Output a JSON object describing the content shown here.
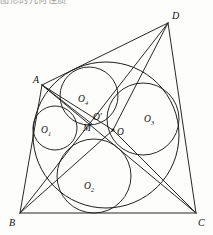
{
  "caption": {
    "clipped_header_text": "图形的几何性质"
  },
  "figure": {
    "ink_color": "#1b1b1b",
    "background_color": "#fdfdfc",
    "vertices": [
      {
        "id": "A",
        "label": "A",
        "x": 42,
        "y": 85,
        "label_x": 33,
        "label_y": 83
      },
      {
        "id": "B",
        "label": "B",
        "x": 20,
        "y": 213,
        "label_x": 9,
        "label_y": 226
      },
      {
        "id": "C",
        "label": "C",
        "x": 196,
        "y": 213,
        "label_x": 198,
        "label_y": 226
      },
      {
        "id": "D",
        "label": "D",
        "x": 168,
        "y": 23,
        "label_x": 172,
        "label_y": 19
      }
    ],
    "points": [
      {
        "id": "O",
        "label": "O",
        "x": 113,
        "y": 130,
        "label_x": 117,
        "label_y": 135
      },
      {
        "id": "Oprime",
        "label": "O′",
        "x": 97,
        "y": 113,
        "label_x": 95,
        "label_y": 120
      },
      {
        "id": "M",
        "label": "M",
        "x": 92,
        "y": 124,
        "label_x": 85,
        "label_y": 131
      }
    ],
    "sides": [
      {
        "id": "AB",
        "from": "A",
        "to": "B"
      },
      {
        "id": "BC",
        "from": "B",
        "to": "C"
      },
      {
        "id": "CD",
        "from": "C",
        "to": "D"
      },
      {
        "id": "DA",
        "from": "D",
        "to": "A"
      }
    ],
    "diagonals": [
      {
        "id": "AC",
        "from": "A",
        "to": "C"
      },
      {
        "id": "BD",
        "from": "B",
        "to": "D"
      }
    ],
    "cevians": [
      {
        "id": "A-O",
        "from": "A",
        "to": "O"
      },
      {
        "id": "B-O",
        "from": "B",
        "to": "O"
      },
      {
        "id": "C-O",
        "from": "C",
        "to": "O"
      },
      {
        "id": "D-O",
        "from": "D",
        "to": "O"
      },
      {
        "id": "A-M",
        "from": "A",
        "to": "M"
      }
    ],
    "circles": [
      {
        "id": "incircle",
        "label": "",
        "cx": 106,
        "cy": 135,
        "r": 73,
        "kind": "main-incircle"
      },
      {
        "id": "O1",
        "label": "O",
        "sub": "1",
        "cx": 55,
        "cy": 128,
        "r": 22,
        "label_x": 44,
        "label_y": 133
      },
      {
        "id": "O2",
        "label": "O",
        "sub": "2",
        "cx": 94,
        "cy": 176,
        "r": 37,
        "label_x": 86,
        "label_y": 189
      },
      {
        "id": "O3",
        "label": "O",
        "sub": "3",
        "cx": 143,
        "cy": 119,
        "r": 36,
        "label_x": 146,
        "label_y": 122
      },
      {
        "id": "O4",
        "label": "O",
        "sub": "4",
        "cx": 89,
        "cy": 96,
        "r": 29,
        "label_x": 80,
        "label_y": 102
      }
    ]
  }
}
